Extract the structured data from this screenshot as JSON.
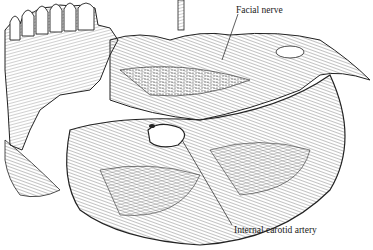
{
  "figure": {
    "style": "black-and-white line engraving",
    "labels": [
      {
        "id": "facial-nerve",
        "text": "Facial nerve"
      },
      {
        "id": "internal-carotid-artery",
        "text": "Internal carotid artery"
      }
    ],
    "colors": {
      "ink": "#1a1a1a",
      "background": "#ffffff"
    }
  }
}
